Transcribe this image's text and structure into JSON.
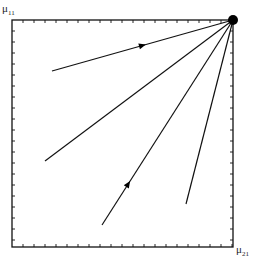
{
  "diagram": {
    "type": "phase-portrait",
    "frame": {
      "x0": 12,
      "y0": 20,
      "x1": 233,
      "y1": 247,
      "stroke": "#111111"
    },
    "ticks": {
      "spacing": 11,
      "length": 3
    },
    "axes": {
      "y_label": {
        "symbol": "μ",
        "subscript": "11"
      },
      "x_label": {
        "symbol": "μ",
        "subscript": "21"
      }
    },
    "attractor": {
      "x": 233,
      "y": 20,
      "r": 5,
      "color": "#000000"
    },
    "trajectories": [
      {
        "from": [
          52,
          71
        ],
        "to": [
          233,
          20
        ],
        "arrow_at": 0.5
      },
      {
        "from": [
          45,
          161
        ],
        "to": [
          233,
          20
        ],
        "arrow_at": null
      },
      {
        "from": [
          102,
          225
        ],
        "to": [
          233,
          20
        ],
        "arrow_at": 0.2
      },
      {
        "from": [
          186,
          204
        ],
        "to": [
          233,
          20
        ],
        "arrow_at": null
      }
    ]
  }
}
